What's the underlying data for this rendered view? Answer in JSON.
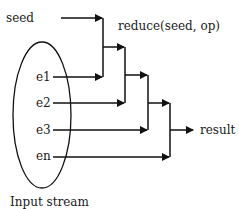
{
  "diagram": {
    "title": "reduce(seed, op)",
    "seed_label": "seed",
    "inputs": [
      {
        "label": "e1"
      },
      {
        "label": "e2"
      },
      {
        "label": "e3"
      },
      {
        "label": "en"
      }
    ],
    "output_label": "result",
    "container_label": "Input stream",
    "colors": {
      "stroke": "#111111",
      "text": "#1a1a1a",
      "background": "#ffffff"
    }
  }
}
